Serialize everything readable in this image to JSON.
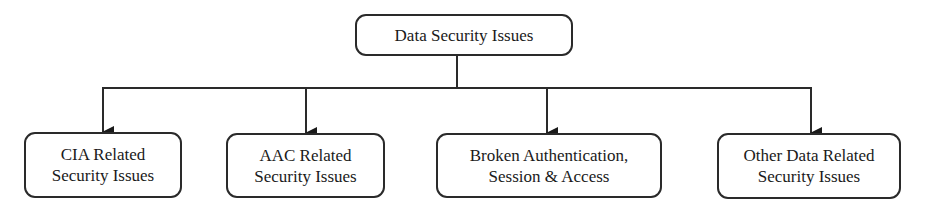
{
  "diagram": {
    "type": "hierarchy",
    "root": {
      "label": "Data Security Issues"
    },
    "children": [
      {
        "label": "CIA Related\nSecurity Issues"
      },
      {
        "label": "AAC Related\nSecurity Issues"
      },
      {
        "label": "Broken Authentication,\nSession & Access"
      },
      {
        "label": "Other Data Related\nSecurity Issues"
      }
    ],
    "edges": [
      {
        "from": "Data Security Issues",
        "to": "CIA Related Security Issues"
      },
      {
        "from": "Data Security Issues",
        "to": "AAC Related Security Issues"
      },
      {
        "from": "Data Security Issues",
        "to": "Broken Authentication, Session & Access"
      },
      {
        "from": "Data Security Issues",
        "to": "Other Data Related Security Issues"
      }
    ],
    "colors": {
      "stroke": "#2a2a2a",
      "background": "#ffffff",
      "text": "#1a1a1a"
    }
  }
}
